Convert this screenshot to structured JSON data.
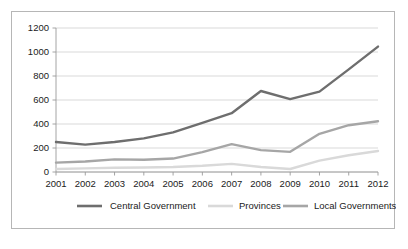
{
  "chart_data": {
    "type": "line",
    "title": "",
    "subtitle": "",
    "xlabel": "",
    "ylabel": "",
    "categories": [
      "2001",
      "2002",
      "2003",
      "2004",
      "2005",
      "2006",
      "2007",
      "2008",
      "2009",
      "2010",
      "2011",
      "2012"
    ],
    "x": [
      2001,
      2002,
      2003,
      2004,
      2005,
      2006,
      2007,
      2008,
      2009,
      2010,
      2011,
      2012
    ],
    "series": [
      {
        "name": "Central Government",
        "color": "#6e6e6e",
        "values": [
          250,
          228,
          250,
          280,
          330,
          410,
          490,
          675,
          608,
          670,
          855,
          1045
        ]
      },
      {
        "name": "Provinces",
        "color": "#d9d9d9",
        "values": [
          25,
          30,
          35,
          38,
          42,
          52,
          68,
          42,
          25,
          95,
          140,
          175
        ]
      },
      {
        "name": "Local Governments",
        "color": "#a6a6a6",
        "values": [
          78,
          88,
          105,
          102,
          112,
          165,
          232,
          182,
          168,
          318,
          390,
          423
        ]
      }
    ],
    "ylim": [
      0,
      1200
    ],
    "yticks": [
      0,
      200,
      400,
      600,
      800,
      1000,
      1200
    ],
    "ytick_labels": [
      "0",
      "200",
      "400",
      "600",
      "800",
      "1000",
      "1200"
    ],
    "xlim": [
      2001,
      2012
    ],
    "grid": "horizontal",
    "legend_position": "bottom",
    "plot_background": "#ffffff",
    "grid_color": "#cfcfcf",
    "axis_color": "#9a9a9a",
    "border_color": "#b6b6b6",
    "text_color": "#1b1b1b"
  },
  "legend": {
    "items": [
      {
        "label": "Central Government"
      },
      {
        "label": "Provinces"
      },
      {
        "label": "Local Governments"
      }
    ]
  }
}
